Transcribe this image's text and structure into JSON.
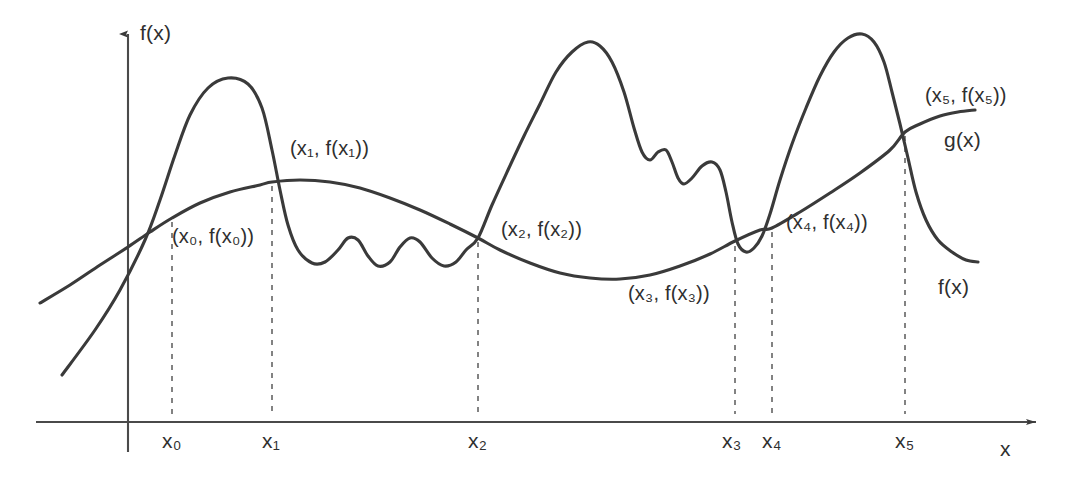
{
  "figure": {
    "background_color": "#ffffff",
    "stroke_color": "#3a3a3a"
  },
  "axes": {
    "y_axis_label": "f(x)",
    "x_axis_label": "x",
    "x_axis_y": 422,
    "y_axis_x": 128
  },
  "curve_labels": {
    "f": "f(x)",
    "g": "g(x)"
  },
  "point_labels": [
    {
      "id": "p0",
      "text": "(x₀, f(x₀))",
      "base": "(x",
      "sub": "0",
      "tail": ", f(x",
      "sub2": "0",
      "tail2": "))"
    },
    {
      "id": "p1",
      "text": "(x₁, f(x₁))"
    },
    {
      "id": "p2",
      "text": "(x₂, f(x₂))"
    },
    {
      "id": "p3",
      "text": "(x₃, f(x₃))"
    },
    {
      "id": "p4",
      "text": "(x₄, f(x₄))"
    },
    {
      "id": "p5",
      "text": "(x₅, f(x₅))"
    }
  ],
  "tick_labels": [
    {
      "id": "t0",
      "text": "x₀"
    },
    {
      "id": "t1",
      "text": "x₁"
    },
    {
      "id": "t2",
      "text": "x₂"
    },
    {
      "id": "t3",
      "text": "x₃"
    },
    {
      "id": "t4",
      "text": "x₄"
    },
    {
      "id": "t5",
      "text": "x₅"
    }
  ],
  "chart_data": {
    "type": "line",
    "title": "",
    "xlabel": "x",
    "ylabel": "f(x)",
    "grid": false,
    "legend": "inline-curve-labels",
    "xlim": [
      0,
      1078
    ],
    "ylim": [
      482,
      0
    ],
    "note": "Pixel coordinates; y increases downward in screen space.",
    "intersections": [
      {
        "name": "(x0, f(x0))",
        "x": 172,
        "y": 218
      },
      {
        "name": "(x1, f(x1))",
        "x": 272,
        "y": 182
      },
      {
        "name": "(x2, f(x2))",
        "x": 478,
        "y": 238
      },
      {
        "name": "(x3, f(x3))",
        "x": 735,
        "y": 241
      },
      {
        "name": "(x4, f(x4))",
        "x": 772,
        "y": 228
      },
      {
        "name": "(x5, f(x5))",
        "x": 905,
        "y": 132
      }
    ],
    "tick_x_positions": [
      172,
      272,
      478,
      735,
      772,
      905
    ],
    "series": [
      {
        "name": "f(x)",
        "description": "Oscillating curve: steep rise to a tall narrow peak, dip with two small ripples, large central peak with two shoulder bumps, sharp drop, narrow dip, tallest peak, then steep fall.",
        "points": [
          [
            62,
            375
          ],
          [
            95,
            330
          ],
          [
            120,
            290
          ],
          [
            145,
            240
          ],
          [
            160,
            200
          ],
          [
            175,
            155
          ],
          [
            190,
            115
          ],
          [
            208,
            88
          ],
          [
            228,
            78
          ],
          [
            248,
            84
          ],
          [
            262,
            108
          ],
          [
            272,
            150
          ],
          [
            280,
            190
          ],
          [
            288,
            225
          ],
          [
            298,
            250
          ],
          [
            312,
            263
          ],
          [
            325,
            262
          ],
          [
            338,
            250
          ],
          [
            348,
            238
          ],
          [
            358,
            240
          ],
          [
            368,
            256
          ],
          [
            378,
            266
          ],
          [
            390,
            262
          ],
          [
            400,
            247
          ],
          [
            410,
            238
          ],
          [
            420,
            242
          ],
          [
            432,
            258
          ],
          [
            444,
            266
          ],
          [
            456,
            262
          ],
          [
            466,
            250
          ],
          [
            478,
            238
          ],
          [
            492,
            205
          ],
          [
            508,
            170
          ],
          [
            524,
            136
          ],
          [
            540,
            104
          ],
          [
            556,
            72
          ],
          [
            572,
            52
          ],
          [
            588,
            42
          ],
          [
            600,
            46
          ],
          [
            612,
            62
          ],
          [
            624,
            92
          ],
          [
            634,
            128
          ],
          [
            642,
            152
          ],
          [
            650,
            160
          ],
          [
            658,
            152
          ],
          [
            666,
            150
          ],
          [
            672,
            162
          ],
          [
            678,
            178
          ],
          [
            684,
            184
          ],
          [
            692,
            178
          ],
          [
            702,
            166
          ],
          [
            712,
            162
          ],
          [
            720,
            170
          ],
          [
            726,
            192
          ],
          [
            732,
            222
          ],
          [
            738,
            244
          ],
          [
            746,
            252
          ],
          [
            754,
            248
          ],
          [
            762,
            236
          ],
          [
            770,
            214
          ],
          [
            780,
            180
          ],
          [
            792,
            144
          ],
          [
            806,
            108
          ],
          [
            820,
            76
          ],
          [
            834,
            52
          ],
          [
            848,
            38
          ],
          [
            862,
            34
          ],
          [
            874,
            42
          ],
          [
            884,
            62
          ],
          [
            892,
            92
          ],
          [
            900,
            124
          ],
          [
            908,
            158
          ],
          [
            916,
            192
          ],
          [
            926,
            220
          ],
          [
            938,
            240
          ],
          [
            952,
            252
          ],
          [
            966,
            260
          ],
          [
            978,
            262
          ]
        ]
      },
      {
        "name": "g(x)",
        "description": "Smooth slowly-varying curve: rises to a broad maximum near x=300, dips to a broad minimum near x=600, then rises again and flattens at the right.",
        "points": [
          [
            40,
            303
          ],
          [
            70,
            285
          ],
          [
            100,
            265
          ],
          [
            128,
            247
          ],
          [
            150,
            232
          ],
          [
            172,
            218
          ],
          [
            200,
            203
          ],
          [
            230,
            192
          ],
          [
            260,
            185
          ],
          [
            272,
            182
          ],
          [
            300,
            180
          ],
          [
            330,
            182
          ],
          [
            360,
            188
          ],
          [
            390,
            198
          ],
          [
            420,
            210
          ],
          [
            450,
            224
          ],
          [
            478,
            238
          ],
          [
            500,
            250
          ],
          [
            530,
            263
          ],
          [
            560,
            273
          ],
          [
            590,
            278
          ],
          [
            620,
            279
          ],
          [
            650,
            275
          ],
          [
            680,
            266
          ],
          [
            710,
            254
          ],
          [
            735,
            241
          ],
          [
            760,
            230
          ],
          [
            772,
            228
          ],
          [
            800,
            212
          ],
          [
            830,
            193
          ],
          [
            860,
            173
          ],
          [
            890,
            150
          ],
          [
            905,
            132
          ],
          [
            920,
            124
          ],
          [
            940,
            116
          ],
          [
            958,
            112
          ],
          [
            975,
            110
          ]
        ]
      }
    ]
  }
}
